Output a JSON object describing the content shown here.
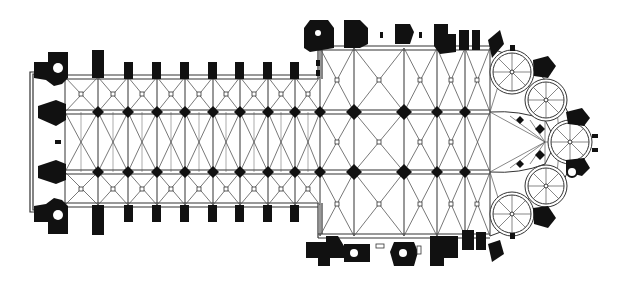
{
  "diagram": {
    "type": "architectural-floor-plan",
    "orientation": "west entrance left, apse right",
    "colors": {
      "ink": "#111111",
      "paper": "#ffffff",
      "rib": "#555555"
    },
    "nave": {
      "bay_x": [
        65,
        98,
        128,
        157,
        185,
        213,
        240,
        268,
        295,
        320
      ],
      "wall_top_y": 77,
      "aisle_top_y": 112,
      "aisle_bottom_y": 172,
      "wall_bottom_y": 205,
      "towers": "twin west towers with round stair turrets"
    },
    "choir": {
      "bay_x": [
        320,
        354,
        404,
        437,
        465,
        490
      ],
      "wall_top_y": 48,
      "wall_bottom_y": 237
    },
    "apse": {
      "center": [
        545,
        142
      ],
      "radiating_chapels": 5
    }
  }
}
